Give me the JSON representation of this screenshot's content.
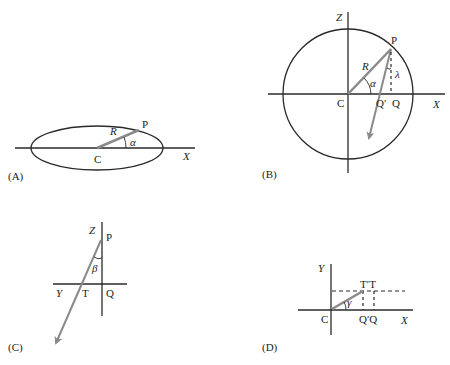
{
  "panels": {
    "A": {
      "caption": "(A)",
      "labels": {
        "center": "C",
        "point": "P",
        "radius": "R",
        "angle": "α",
        "axis_x": "X"
      }
    },
    "B": {
      "caption": "(B)",
      "labels": {
        "center": "C",
        "point": "P",
        "radius": "R",
        "angle_alpha": "α",
        "angle_lambda": "λ",
        "q_prime": "Q′",
        "q": "Q",
        "axis_x": "X",
        "axis_z": "Z"
      }
    },
    "C": {
      "caption": "(C)",
      "labels": {
        "point": "P",
        "angle": "β",
        "t": "T",
        "q": "Q",
        "axis_y": "Y",
        "axis_z": "Z"
      }
    },
    "D": {
      "caption": "(D)",
      "labels": {
        "center": "C",
        "angle": "γ",
        "t_prime_t": "T′T",
        "q_prime_q": "Q′Q",
        "axis_x": "X",
        "axis_y": "Y"
      }
    }
  },
  "colors": {
    "line": "#2a2a2a",
    "vector": "#8a8a8a"
  }
}
